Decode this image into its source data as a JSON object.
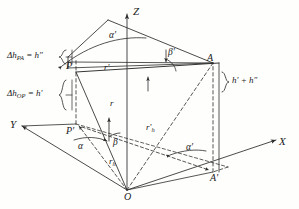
{
  "figure": {
    "type": "3d-coordinate-geometry-diagram",
    "background_color": "#fefefd",
    "line_color": "#2b2b2b"
  },
  "axes": [
    {
      "name": "z-axis",
      "label": "Z"
    },
    {
      "name": "x-axis",
      "label": "X"
    },
    {
      "name": "y-axis",
      "label": "Y"
    }
  ],
  "points": [
    {
      "name": "point-p",
      "label": "P"
    },
    {
      "name": "point-p-prime",
      "label": "P'"
    },
    {
      "name": "point-a",
      "label": "A"
    },
    {
      "name": "point-a-prime",
      "label": "A'"
    },
    {
      "name": "origin",
      "label": "O"
    }
  ],
  "angles": [
    {
      "name": "angle-alpha",
      "label": "α",
      "location": "horizontal plane at P'"
    },
    {
      "name": "angle-beta",
      "label": "β",
      "location": "horizontal plane at P'"
    },
    {
      "name": "angle-alpha-prime-top",
      "label": "α'",
      "location": "upper triangle apex"
    },
    {
      "name": "angle-alpha-prime-bottom",
      "label": "α'",
      "location": "horizontal plane near A'"
    },
    {
      "name": "angle-beta-prime",
      "label": "β'",
      "location": "upper triangle near A"
    }
  ],
  "segments": [
    {
      "name": "segment-r-prime",
      "label": "r'",
      "description": "horizontal slope line from P to A"
    },
    {
      "name": "segment-r",
      "label": "r",
      "description": "slant line from O toward P region"
    },
    {
      "name": "segment-rh",
      "label": "r",
      "sub": "h",
      "description": "horizontal projection distance"
    },
    {
      "name": "segment-rh-prime",
      "label": "r'",
      "sub": "h",
      "description": "horizontal projection of r prime"
    }
  ],
  "brackets": [
    {
      "name": "delta-h-pa-label",
      "text": "Δh",
      "subscript": "PA",
      "equals": "=",
      "value": "h″",
      "full": "Δh_PA = h″"
    },
    {
      "name": "delta-h-op-label",
      "text": "Δh",
      "subscript": "OP",
      "equals": "=",
      "value": "h′",
      "full": "Δh_OP = h′"
    },
    {
      "name": "height-sum-label",
      "full": "h′ + h″"
    }
  ]
}
